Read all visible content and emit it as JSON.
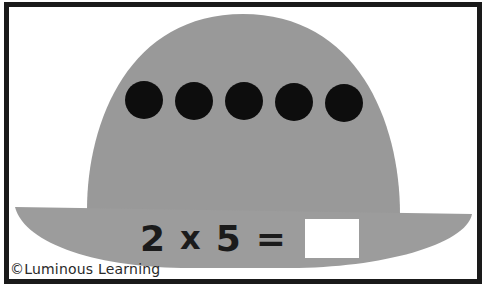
{
  "colors": {
    "border": "#1a1a1a",
    "hat_fill": "#999999",
    "dot_fill": "#0d0d0d",
    "background": "#ffffff",
    "answer_box": "#ffffff",
    "text": "#1b1b1b"
  },
  "hat": {
    "dots": {
      "count": 5,
      "items": [
        "dot",
        "dot",
        "dot",
        "dot",
        "dot"
      ]
    }
  },
  "equation": {
    "factor_a": "2",
    "operator": "x",
    "factor_b": "5",
    "equals": "=",
    "answer": "",
    "answer_placeholder": ""
  },
  "footer": {
    "copyright": "©Luminous Learning"
  }
}
